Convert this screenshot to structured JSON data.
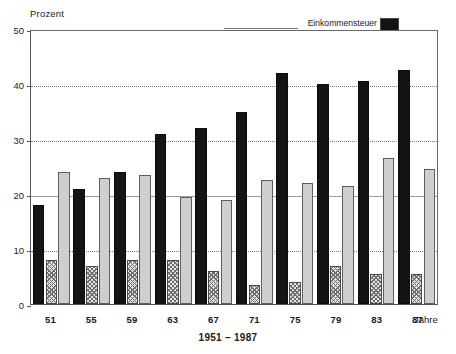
{
  "chart": {
    "y_axis_title": "Prozent",
    "x_axis_title": "Jahre",
    "caption": "1951 – 1987"
  },
  "legend": {
    "items": [
      {
        "label": "Einkommensteuer",
        "swatch": "solid-black-swatch"
      },
      {
        "label": "Körperschaftssteuer",
        "swatch": "hatched-swatch"
      },
      {
        "label": "Umsatzsteuer",
        "swatch": "light-gray-swatch"
      }
    ]
  },
  "y_axis": {
    "ticks": [
      "0",
      "10",
      "20",
      "30",
      "40",
      "50"
    ]
  },
  "chart_data": {
    "type": "bar",
    "title": "",
    "subtitle": "",
    "xlabel": "Jahre",
    "ylabel": "Prozent",
    "caption": "1951 – 1987",
    "categories": [
      "51",
      "55",
      "59",
      "63",
      "67",
      "71",
      "75",
      "79",
      "83",
      "87"
    ],
    "ylim": [
      0,
      50
    ],
    "yticks": [
      0,
      10,
      20,
      30,
      40,
      50
    ],
    "grid": true,
    "legend_position": "top-right",
    "series": [
      {
        "name": "Einkommensteuer",
        "color": "#141414",
        "values": [
          18,
          21,
          24,
          31,
          32,
          35,
          42,
          40,
          40.5,
          42.5
        ]
      },
      {
        "name": "Körperschaftssteuer",
        "color": "#e4e4e4",
        "values": [
          8,
          7,
          8,
          8,
          6,
          3.5,
          4,
          7,
          5.5,
          5.5
        ]
      },
      {
        "name": "Umsatzsteuer",
        "color": "#cfcfcf",
        "values": [
          24,
          23,
          23.5,
          19.5,
          19,
          22.5,
          22,
          21.5,
          26.5,
          24.5
        ]
      }
    ]
  }
}
